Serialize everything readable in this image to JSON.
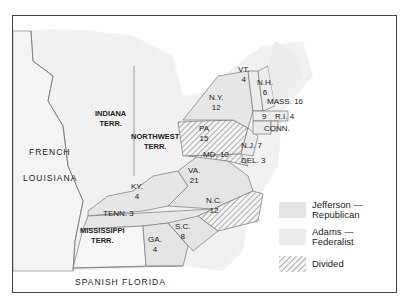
{
  "colors": {
    "republican": "#e4e4e4",
    "federalist": "#ececec",
    "divided_stripe": "#888888",
    "territory": "#f2f2f2",
    "border": "#777777"
  },
  "regions": {
    "indiana": "INDIANA\nTERR.",
    "northwest": "NORTHWEST\nTERR.",
    "french": "FRENCH",
    "louisiana": "LOUISIANA",
    "mississippi": "MISSISSIPPI\nTERR.",
    "spanish_florida": "SPANISH FLORIDA"
  },
  "states": [
    {
      "name": "VT.",
      "votes": "4"
    },
    {
      "name": "N.H.",
      "votes": "6"
    },
    {
      "name": "N.Y.",
      "votes": "12"
    },
    {
      "name": "MASS.",
      "votes": "16"
    },
    {
      "name": "R.I.",
      "votes": "4"
    },
    {
      "name": "CONN.",
      "votes": "9"
    },
    {
      "name": "PA",
      "votes": "15"
    },
    {
      "name": "N.J.",
      "votes": "7"
    },
    {
      "name": "MD.",
      "votes": "10"
    },
    {
      "name": "DEL.",
      "votes": "3"
    },
    {
      "name": "VA.",
      "votes": "21"
    },
    {
      "name": "KY.",
      "votes": "4"
    },
    {
      "name": "TENN.",
      "votes": "3"
    },
    {
      "name": "N.C.",
      "votes": "12"
    },
    {
      "name": "S.C.",
      "votes": "8"
    },
    {
      "name": "GA.",
      "votes": "4"
    }
  ],
  "legend": [
    {
      "label1": "Jefferson —",
      "label2": "Republican"
    },
    {
      "label1": "Adams —",
      "label2": "Federalist"
    },
    {
      "label1": "Divided",
      "label2": ""
    }
  ]
}
